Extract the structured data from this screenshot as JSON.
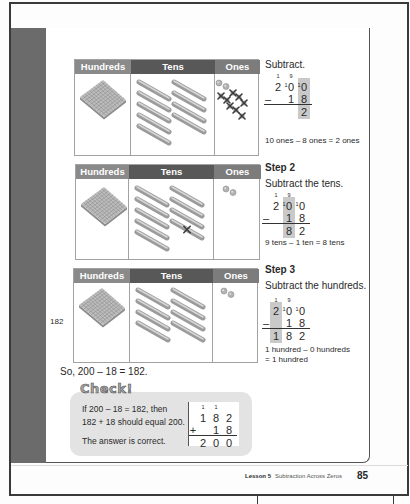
{
  "colors": {
    "header_hundreds": "#8a8a8a",
    "header_tens": "#585858",
    "header_ones": "#7c7c7c",
    "sidebar": "#6b6b6b",
    "highlight": "#c9c9c9",
    "check_bg": "#e3e3e3"
  },
  "tables": [
    {
      "headers": {
        "hundreds": "Hundreds",
        "tens": "Tens",
        "ones": "Ones"
      },
      "blocks": {
        "hundreds": 1,
        "tens_columns": [
          5,
          4
        ],
        "tens_crossed": [],
        "ones": 2,
        "ones_crossed": 8
      }
    },
    {
      "headers": {
        "hundreds": "Hundreds",
        "tens": "Tens",
        "ones": "Ones"
      },
      "blocks": {
        "hundreds": 1,
        "tens_columns": [
          5,
          4
        ],
        "tens_crossed": [
          [
            1,
            3
          ]
        ],
        "ones": 2,
        "ones_crossed": 0
      }
    },
    {
      "headers": {
        "hundreds": "Hundreds",
        "tens": "Tens",
        "ones": "Ones"
      },
      "blocks": {
        "hundreds": 1,
        "tens_columns": [
          4,
          4
        ],
        "tens_crossed": [],
        "ones": 2,
        "ones_crossed": 0
      }
    }
  ],
  "steps": [
    {
      "title": "",
      "instruction": "Subtract.",
      "stack": {
        "carry": [
          "1",
          "9",
          ""
        ],
        "regroup": [
          "",
          "1",
          "1"
        ],
        "top": [
          "2",
          "0",
          "0"
        ],
        "op": "–",
        "sub": [
          "",
          "1",
          "8"
        ],
        "result": [
          "",
          "",
          "2"
        ],
        "highlight": 2
      },
      "explanation": [
        "10 ones – 8 ones = 2 ones"
      ]
    },
    {
      "title": "Step 2",
      "instruction": "Subtract the tens.",
      "stack": {
        "carry": [
          "1",
          "9",
          ""
        ],
        "regroup": [
          "",
          "1",
          "1"
        ],
        "top": [
          "2",
          "0",
          "0"
        ],
        "op": "–",
        "sub": [
          "",
          "1",
          "8"
        ],
        "result": [
          "",
          "8",
          "2"
        ],
        "highlight": 1
      },
      "explanation": [
        "9 tens – 1 ten = 8 tens"
      ]
    },
    {
      "title": "Step 3",
      "instruction": "Subtract the hundreds.",
      "stack": {
        "carry": [
          "1",
          "9",
          ""
        ],
        "regroup": [
          "",
          "1",
          "1"
        ],
        "top": [
          "2",
          "0",
          "0"
        ],
        "op": "–",
        "sub": [
          "",
          "1",
          "8"
        ],
        "result": [
          "1",
          "8",
          "2"
        ],
        "highlight": 0
      },
      "explanation": [
        "1 hundred – 0 hundreds",
        "= 1 hundred"
      ]
    }
  ],
  "side_label": "182",
  "conclusion": "So, 200 – 18 = 182.",
  "check": {
    "title": "Check!",
    "lines": [
      "If 200 – 18 = 182, then",
      "182 + 18 should equal 200.",
      "The answer is correct."
    ],
    "addition": {
      "carry": [
        "1",
        "1",
        ""
      ],
      "regroup": [
        "",
        "",
        ""
      ],
      "top": [
        "1",
        "8",
        "2"
      ],
      "op": "+",
      "sub": [
        "",
        "1",
        "8"
      ],
      "result": [
        "2",
        "0",
        "0"
      ],
      "highlight": -1
    }
  },
  "footer": {
    "lesson": "Lesson 5",
    "title": "Subtraction Across Zeros",
    "page": "85"
  }
}
